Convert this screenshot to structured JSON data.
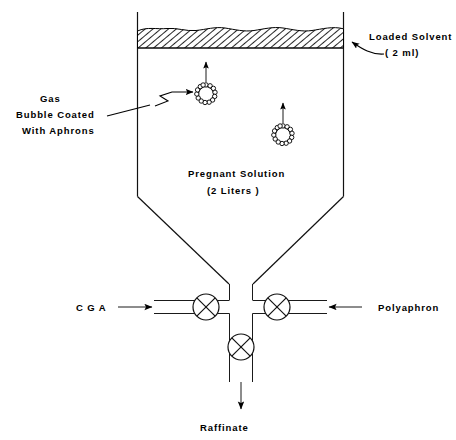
{
  "diagram": {
    "type": "process-flow-diagram",
    "colors": {
      "line": "#111111",
      "background": "#ffffff",
      "hatch": "#000000"
    },
    "labels": {
      "loaded_solvent": {
        "line1": "Loaded Solvent",
        "line2": "( 2 ml)"
      },
      "gas_bubble": {
        "line1": "Gas",
        "line2": "Bubble Coated",
        "line3": "With  Aphrons"
      },
      "pregnant_solution": {
        "line1": "Pregnant Solution",
        "line2": "(2 Liters )"
      },
      "cga": "C G A",
      "polyaphron": "Polyaphron",
      "raffinate": "Raffinate"
    },
    "vessel": {
      "left_wall_x": 137,
      "right_wall_x": 343,
      "top_y": 12,
      "cone_start_y": 196,
      "cone_apex_y": 284
    },
    "solvent_layer": {
      "top_y": 28,
      "bottom_y": 48,
      "hatch_pattern": "diagonal-lines",
      "surface": "wavy"
    },
    "bubbles": [
      {
        "name": "bubble-upper-left",
        "cx": 206,
        "cy": 94,
        "r": 9,
        "spikes": 13,
        "arrow_from_y": 82,
        "arrow_to_y": 62
      },
      {
        "name": "bubble-lower-right",
        "cx": 283,
        "cy": 135,
        "r": 9,
        "spikes": 13,
        "arrow_from_y": 123,
        "arrow_to_y": 103
      }
    ],
    "valves": [
      {
        "name": "valve-cga-inlet",
        "cx": 206,
        "cy": 307,
        "r": 13
      },
      {
        "name": "valve-polyaphron-inlet",
        "cx": 277,
        "cy": 307,
        "r": 13
      },
      {
        "name": "valve-raffinate-outlet",
        "cx": 241,
        "cy": 347,
        "r": 13
      }
    ],
    "flow_arrows": [
      {
        "name": "arrow-cga-in",
        "direction": "right",
        "x1": 118,
        "y1": 307,
        "x2": 155,
        "y2": 307
      },
      {
        "name": "arrow-polyaphron-in",
        "direction": "left",
        "x1": 360,
        "y1": 307,
        "x2": 322,
        "y2": 307
      },
      {
        "name": "arrow-raffinate-out",
        "direction": "down",
        "x1": 241,
        "y1": 382,
        "x2": 241,
        "y2": 408
      }
    ]
  }
}
